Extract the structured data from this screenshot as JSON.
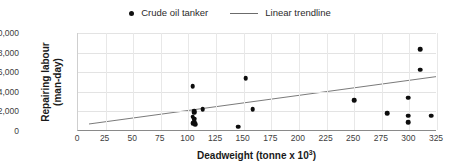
{
  "chart_data": {
    "type": "scatter",
    "title": "",
    "xlabel": "Deadweight (tonne x 10³)",
    "xlabel_base": "Deadweight (tonne x 10",
    "xlabel_sup": "3",
    "xlabel_tail": ")",
    "ylabel_line1": "Repairing labour",
    "ylabel_line2": "(man-day)",
    "ylabel": "Repairing labour (man-day)",
    "xlim": [
      0,
      325
    ],
    "ylim": [
      0,
      10000
    ],
    "xticks": [
      0,
      25,
      50,
      75,
      100,
      125,
      150,
      175,
      200,
      225,
      250,
      275,
      300,
      325
    ],
    "xtick_labels": [
      "0",
      "25",
      "50",
      "75",
      "100",
      "125",
      "150",
      "175",
      "200",
      "225",
      "250",
      "275",
      "300",
      "325"
    ],
    "yticks": [
      0,
      2000,
      4000,
      6000,
      8000,
      10000
    ],
    "ytick_labels": [
      "0",
      "2,000",
      "4,000",
      "6,000",
      "8,000",
      "10,000"
    ],
    "grid": "horizontal-and-vertical",
    "legend_position": "top-center",
    "marker_color": "#0d0d0d",
    "trendline_color": "#6b6b6b",
    "series": [
      {
        "name": "Crude oil tanker",
        "marker": "circle",
        "points": [
          [
            104,
            4550
          ],
          [
            105,
            2000
          ],
          [
            105,
            1850
          ],
          [
            104,
            1450
          ],
          [
            105,
            1250
          ],
          [
            105,
            950
          ],
          [
            104,
            800
          ],
          [
            106,
            700
          ],
          [
            113,
            2250
          ],
          [
            145,
            450
          ],
          [
            152,
            5400
          ],
          [
            158,
            2200
          ],
          [
            250,
            3150
          ],
          [
            280,
            1800
          ],
          [
            299,
            3400
          ],
          [
            299,
            1550
          ],
          [
            299,
            900
          ],
          [
            310,
            8350
          ],
          [
            310,
            6250
          ],
          [
            320,
            1550
          ]
        ]
      }
    ],
    "trendline": {
      "name": "Linear trendline",
      "x_start": 10,
      "y_start": 620,
      "x_end": 325,
      "y_end": 5500
    }
  },
  "legend": {
    "entries": [
      {
        "label": "Crude oil tanker",
        "marker": "dot-marker",
        "color": "#0d0d0d"
      },
      {
        "label": "Linear trendline",
        "marker": "line-marker",
        "color": "#6b6b6b"
      }
    ]
  }
}
